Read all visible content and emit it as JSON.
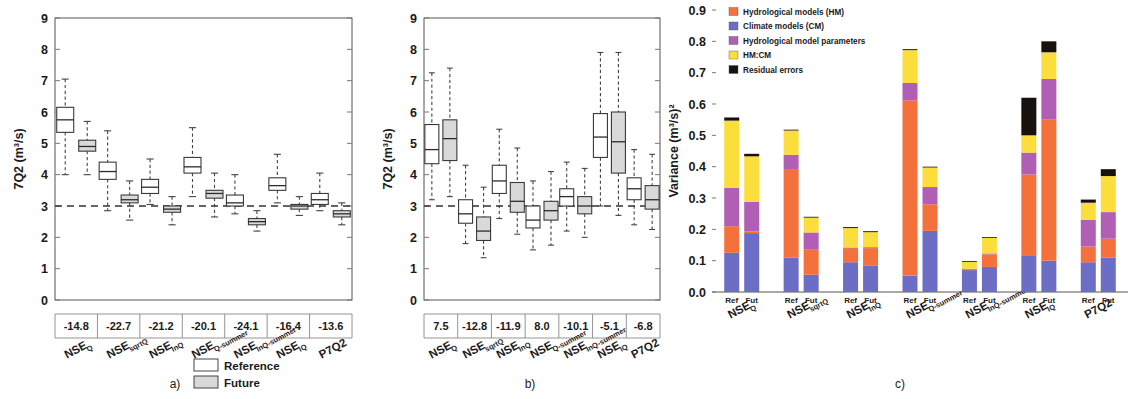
{
  "figure": {
    "panel_a_label": "a)",
    "panel_b_label": "b)",
    "panel_c_label": "c)"
  },
  "shared_legend": {
    "reference_label": "Reference",
    "future_label": "Future",
    "reference_color": "#ffffff",
    "future_color": "#d9d9d9"
  },
  "chart_data": [
    {
      "id": "panel_a",
      "type": "box",
      "title": "",
      "xlabel": "",
      "ylabel": "7Q2 (m³/s)",
      "ylim": [
        0,
        9
      ],
      "yticks": [
        "0",
        "1",
        "2",
        "3",
        "4",
        "5",
        "6",
        "7",
        "8",
        "9"
      ],
      "reference_line": 3.0,
      "categories": [
        "NSE",
        "NSE",
        "NSE",
        "NSE",
        "NSE",
        "NSE",
        "P7Q2"
      ],
      "category_subscripts": [
        "Q",
        "sqrtQ",
        "lnQ",
        "Q-summer",
        "lnQ-summer",
        "iQ",
        ""
      ],
      "value_row": [
        "-14.8",
        "-22.7",
        "-21.2",
        "-20.1",
        "-24.1",
        "-16.4",
        "-13.6"
      ],
      "series": [
        {
          "name": "Reference",
          "boxes": [
            {
              "min": 4.0,
              "q1": 5.35,
              "median": 5.75,
              "q3": 6.15,
              "max": 7.05
            },
            {
              "min": 2.85,
              "q1": 3.85,
              "median": 4.1,
              "q3": 4.4,
              "max": 5.4
            },
            {
              "min": 3.05,
              "q1": 3.4,
              "median": 3.6,
              "q3": 3.85,
              "max": 4.5
            },
            {
              "min": 3.3,
              "q1": 4.05,
              "median": 4.25,
              "q3": 4.55,
              "max": 5.5
            },
            {
              "min": 2.75,
              "q1": 3.0,
              "median": 3.1,
              "q3": 3.35,
              "max": 4.0
            },
            {
              "min": 3.1,
              "q1": 3.5,
              "median": 3.65,
              "q3": 3.9,
              "max": 4.65
            },
            {
              "min": 2.85,
              "q1": 3.05,
              "median": 3.2,
              "q3": 3.4,
              "max": 4.05
            }
          ]
        },
        {
          "name": "Future",
          "boxes": [
            {
              "min": 4.0,
              "q1": 4.75,
              "median": 4.9,
              "q3": 5.1,
              "max": 5.7
            },
            {
              "min": 2.55,
              "q1": 3.1,
              "median": 3.2,
              "q3": 3.35,
              "max": 3.8
            },
            {
              "min": 2.4,
              "q1": 2.8,
              "median": 2.9,
              "q3": 3.0,
              "max": 3.3
            },
            {
              "min": 2.65,
              "q1": 3.25,
              "median": 3.4,
              "q3": 3.5,
              "max": 4.05
            },
            {
              "min": 2.2,
              "q1": 2.4,
              "median": 2.5,
              "q3": 2.6,
              "max": 2.85
            },
            {
              "min": 2.7,
              "q1": 2.9,
              "median": 3.0,
              "q3": 3.05,
              "max": 3.3
            },
            {
              "min": 2.4,
              "q1": 2.65,
              "median": 2.75,
              "q3": 2.85,
              "max": 3.1
            }
          ]
        }
      ]
    },
    {
      "id": "panel_b",
      "type": "box",
      "title": "",
      "xlabel": "",
      "ylabel": "7Q2 (m³/s)",
      "ylim": [
        0,
        9
      ],
      "yticks": [
        "0",
        "1",
        "2",
        "3",
        "4",
        "5",
        "6",
        "7",
        "8",
        "9"
      ],
      "reference_line": 3.0,
      "categories": [
        "NSE",
        "NSE",
        "NSE",
        "NSE",
        "NSE",
        "NSE",
        "P7Q2"
      ],
      "category_subscripts": [
        "Q",
        "sqrtQ",
        "lnQ",
        "Q-summer",
        "lnQ-summer",
        "iQ",
        ""
      ],
      "value_row": [
        "7.5",
        "-12.8",
        "-11.9",
        "8.0",
        "-10.1",
        "-5.1",
        "-6.8"
      ],
      "series": [
        {
          "name": "Reference",
          "boxes": [
            {
              "min": 3.2,
              "q1": 4.35,
              "median": 4.8,
              "q3": 5.6,
              "max": 7.25
            },
            {
              "min": 1.8,
              "q1": 2.45,
              "median": 2.75,
              "q3": 3.2,
              "max": 4.3
            },
            {
              "min": 2.6,
              "q1": 3.4,
              "median": 3.8,
              "q3": 4.3,
              "max": 5.45
            },
            {
              "min": 1.6,
              "q1": 2.3,
              "median": 2.55,
              "q3": 3.0,
              "max": 3.8
            },
            {
              "min": 2.2,
              "q1": 3.0,
              "median": 3.3,
              "q3": 3.55,
              "max": 4.4
            },
            {
              "min": 3.0,
              "q1": 4.55,
              "median": 5.2,
              "q3": 5.95,
              "max": 7.9
            },
            {
              "min": 2.4,
              "q1": 3.2,
              "median": 3.55,
              "q3": 3.9,
              "max": 4.8
            }
          ]
        },
        {
          "name": "Future",
          "boxes": [
            {
              "min": 3.3,
              "q1": 4.45,
              "median": 5.15,
              "q3": 5.75,
              "max": 7.4
            },
            {
              "min": 1.35,
              "q1": 1.9,
              "median": 2.2,
              "q3": 2.65,
              "max": 3.6
            },
            {
              "min": 2.1,
              "q1": 2.8,
              "median": 3.15,
              "q3": 3.75,
              "max": 4.85
            },
            {
              "min": 1.75,
              "q1": 2.55,
              "median": 2.85,
              "q3": 3.15,
              "max": 4.1
            },
            {
              "min": 2.0,
              "q1": 2.75,
              "median": 3.0,
              "q3": 3.3,
              "max": 4.2
            },
            {
              "min": 2.7,
              "q1": 4.05,
              "median": 5.05,
              "q3": 6.0,
              "max": 7.9
            },
            {
              "min": 2.25,
              "q1": 2.9,
              "median": 3.2,
              "q3": 3.65,
              "max": 4.65
            }
          ]
        }
      ]
    },
    {
      "id": "panel_c",
      "type": "bar",
      "stacked": true,
      "title": "",
      "xlabel": "",
      "ylabel": "Variance (m³/s)²",
      "ylim": [
        0.0,
        0.9
      ],
      "yticks": [
        "0.0",
        "0.1",
        "0.2",
        "0.3",
        "0.4",
        "0.5",
        "0.6",
        "0.7",
        "0.8",
        "0.9"
      ],
      "legend_position": "top-left",
      "legend": [
        {
          "label": "Hydrological models (HM)",
          "color": "#F4713B"
        },
        {
          "label": "Climate models (CM)",
          "color": "#6C6DC4"
        },
        {
          "label": "Hydrological model parameters",
          "color": "#B05FB5"
        },
        {
          "label": "HM:CM",
          "color": "#FBDE3C"
        },
        {
          "label": "Residual errors",
          "color": "#18120E"
        }
      ],
      "categories": [
        "NSE",
        "NSE",
        "NSE",
        "NSE",
        "NSE",
        "NSE",
        "P7Q2"
      ],
      "category_subscripts": [
        "Q",
        "sqrtQ",
        "lnQ",
        "Q-summer",
        "lnQ-summer",
        "iQ",
        ""
      ],
      "scenario_labels": [
        "Ref",
        "Fut"
      ],
      "bars": [
        {
          "group": "NSE_Q",
          "scenario": "Ref",
          "segments": {
            "Climate models (CM)": 0.125,
            "Hydrological models (HM)": 0.085,
            "Hydrological model parameters": 0.122,
            "HM:CM": 0.215,
            "Residual errors": 0.01
          },
          "total": 0.557
        },
        {
          "group": "NSE_Q",
          "scenario": "Fut",
          "segments": {
            "Climate models (CM)": 0.188,
            "Hydrological models (HM)": 0.005,
            "Hydrological model parameters": 0.095,
            "HM:CM": 0.145,
            "Residual errors": 0.008
          },
          "total": 0.441
        },
        {
          "group": "NSE_sqrtQ",
          "scenario": "Ref",
          "segments": {
            "Climate models (CM)": 0.11,
            "Hydrological models (HM)": 0.28,
            "Hydrological model parameters": 0.048,
            "HM:CM": 0.078,
            "Residual errors": 0.002
          },
          "total": 0.518
        },
        {
          "group": "NSE_sqrtQ",
          "scenario": "Fut",
          "segments": {
            "Climate models (CM)": 0.055,
            "Hydrological models (HM)": 0.08,
            "Hydrological model parameters": 0.055,
            "HM:CM": 0.048,
            "Residual errors": 0.002
          },
          "total": 0.24
        },
        {
          "group": "NSE_lnQ",
          "scenario": "Ref",
          "segments": {
            "Climate models (CM)": 0.095,
            "Hydrological models (HM)": 0.045,
            "Hydrological model parameters": 0.002,
            "HM:CM": 0.062,
            "Residual errors": 0.003
          },
          "total": 0.207
        },
        {
          "group": "NSE_lnQ",
          "scenario": "Fut",
          "segments": {
            "Climate models (CM)": 0.085,
            "Hydrological models (HM)": 0.055,
            "Hydrological model parameters": 0.003,
            "HM:CM": 0.048,
            "Residual errors": 0.003
          },
          "total": 0.194
        },
        {
          "group": "NSE_Q-summer",
          "scenario": "Ref",
          "segments": {
            "Climate models (CM)": 0.052,
            "Hydrological models (HM)": 0.56,
            "Hydrological model parameters": 0.055,
            "HM:CM": 0.105,
            "Residual errors": 0.003
          },
          "total": 0.775
        },
        {
          "group": "NSE_Q-summer",
          "scenario": "Fut",
          "segments": {
            "Climate models (CM)": 0.195,
            "Hydrological models (HM)": 0.085,
            "Hydrological model parameters": 0.055,
            "HM:CM": 0.063,
            "Residual errors": 0.002
          },
          "total": 0.4
        },
        {
          "group": "NSE_lnQ-summer",
          "scenario": "Ref",
          "segments": {
            "Climate models (CM)": 0.07,
            "Hydrological models (HM)": 0.002,
            "Hydrological model parameters": 0.002,
            "HM:CM": 0.023,
            "Residual errors": 0.002
          },
          "total": 0.099
        },
        {
          "group": "NSE_lnQ-summer",
          "scenario": "Fut",
          "segments": {
            "Climate models (CM)": 0.08,
            "Hydrological models (HM)": 0.04,
            "Hydrological model parameters": 0.003,
            "HM:CM": 0.05,
            "Residual errors": 0.002
          },
          "total": 0.175
        },
        {
          "group": "NSE_iQ",
          "scenario": "Ref",
          "segments": {
            "Climate models (CM)": 0.115,
            "Hydrological models (HM)": 0.26,
            "Hydrological model parameters": 0.07,
            "HM:CM": 0.055,
            "Residual errors": 0.12
          },
          "total": 0.62
        },
        {
          "group": "NSE_iQ",
          "scenario": "Fut",
          "segments": {
            "Climate models (CM)": 0.1,
            "Hydrological models (HM)": 0.45,
            "Hydrological model parameters": 0.13,
            "HM:CM": 0.085,
            "Residual errors": 0.035
          },
          "total": 0.8
        },
        {
          "group": "P7Q2",
          "scenario": "Ref",
          "segments": {
            "Climate models (CM)": 0.095,
            "Hydrological models (HM)": 0.05,
            "Hydrological model parameters": 0.085,
            "HM:CM": 0.055,
            "Residual errors": 0.01
          },
          "total": 0.295
        },
        {
          "group": "P7Q2",
          "scenario": "Fut",
          "segments": {
            "Climate models (CM)": 0.11,
            "Hydrological models (HM)": 0.06,
            "Hydrological model parameters": 0.085,
            "HM:CM": 0.115,
            "Residual errors": 0.022
          },
          "total": 0.392
        }
      ]
    }
  ]
}
